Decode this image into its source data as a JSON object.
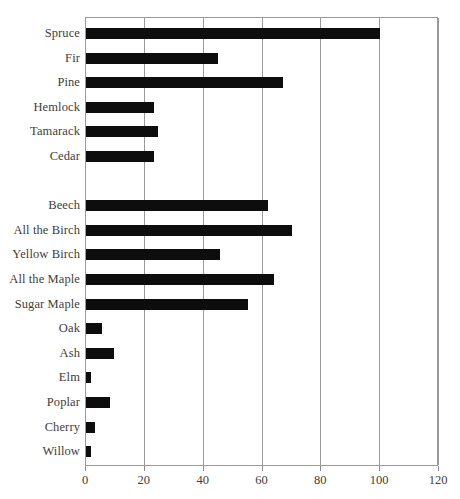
{
  "chart_data": {
    "type": "bar",
    "orientation": "horizontal",
    "title": "",
    "xlabel": "",
    "ylabel": "",
    "xlim": [
      0,
      120
    ],
    "xticks": [
      0,
      20,
      40,
      60,
      80,
      100,
      120
    ],
    "grid": "vertical",
    "legend": "none",
    "bar_color": "#0d0d0d",
    "categories": [
      "Spruce",
      "Fir",
      "Pine",
      "Hemlock",
      "Tamarack",
      "Cedar",
      "",
      "Beech",
      "All the Birch",
      "Yellow Birch",
      "All the Maple",
      "Sugar Maple",
      "Oak",
      "Ash",
      "Elm",
      "Poplar",
      "Cherry",
      "Willow"
    ],
    "values": [
      100,
      45,
      67,
      23,
      24.5,
      23,
      null,
      62,
      70,
      45.5,
      64,
      55,
      5.5,
      9.5,
      1.7,
      8,
      3,
      1.7
    ]
  },
  "rows": [
    {
      "label": "Spruce",
      "value": 100
    },
    {
      "label": "Fir",
      "value": 45
    },
    {
      "label": "Pine",
      "value": 67
    },
    {
      "label": "Hemlock",
      "value": 23
    },
    {
      "label": "Tamarack",
      "value": 24.5
    },
    {
      "label": "Cedar",
      "value": 23
    },
    {
      "label": "",
      "value": null
    },
    {
      "label": "Beech",
      "value": 62
    },
    {
      "label": "All the Birch",
      "value": 70
    },
    {
      "label": "Yellow Birch",
      "value": 45.5
    },
    {
      "label": "All the Maple",
      "value": 64
    },
    {
      "label": "Sugar Maple",
      "value": 55
    },
    {
      "label": "Oak",
      "value": 5.5
    },
    {
      "label": "Ash",
      "value": 9.5
    },
    {
      "label": "Elm",
      "value": 1.7
    },
    {
      "label": "Poplar",
      "value": 8
    },
    {
      "label": "Cherry",
      "value": 3
    },
    {
      "label": "Willow",
      "value": 1.7
    }
  ],
  "axis": {
    "ticks": [
      {
        "label": "0",
        "value": 0
      },
      {
        "label": "20",
        "value": 20
      },
      {
        "label": "40",
        "value": 40
      },
      {
        "label": "60",
        "value": 60
      },
      {
        "label": "80",
        "value": 80
      },
      {
        "label": "100",
        "value": 100
      },
      {
        "label": "120",
        "value": 120
      }
    ]
  }
}
